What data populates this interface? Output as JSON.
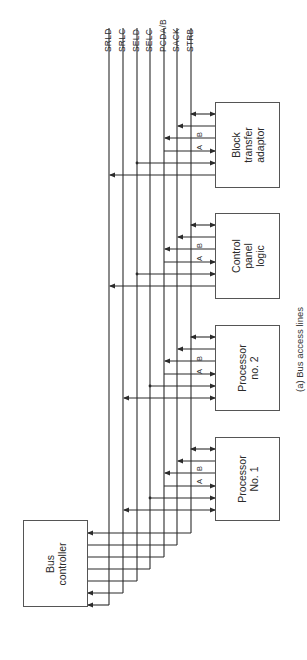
{
  "figure": {
    "caption": "(a)  Bus access lines",
    "bus_lines": [
      {
        "id": "SRLD",
        "label": "SRLD",
        "x": 109
      },
      {
        "id": "SRLC",
        "label": "SRLC",
        "x": 123
      },
      {
        "id": "SELD",
        "label": "SELD",
        "x": 137
      },
      {
        "id": "SELC",
        "label": "SELC",
        "x": 150
      },
      {
        "id": "PCDA/B",
        "label": "PCDA/B",
        "x": 164
      },
      {
        "id": "SACK",
        "label": "SACK",
        "x": 177
      },
      {
        "id": "STRB",
        "label": "STRB",
        "x": 191
      }
    ],
    "devices": [
      {
        "id": "block-transfer-adaptor",
        "label": "Block\ntransfer\nadaptor",
        "x": 215,
        "y": 102,
        "w": 65,
        "h": 86
      },
      {
        "id": "control-panel-logic",
        "label": "Control\npanel\nlogic",
        "x": 215,
        "y": 213,
        "w": 65,
        "h": 86
      },
      {
        "id": "processor-2",
        "label": "Processor\nno. 2",
        "x": 215,
        "y": 325,
        "w": 65,
        "h": 86
      },
      {
        "id": "processor-1",
        "label": "Processor\nNo. 1",
        "x": 215,
        "y": 437,
        "w": 65,
        "h": 84
      }
    ],
    "bus_controller": {
      "label": "Bus\ncontroller",
      "x": 23,
      "y": 520,
      "w": 65,
      "h": 87
    },
    "port_labels": {
      "a": "A",
      "b": "B"
    },
    "colors": {
      "line": "#2b2b2b",
      "box_border": "#555555",
      "background": "#ffffff"
    }
  }
}
